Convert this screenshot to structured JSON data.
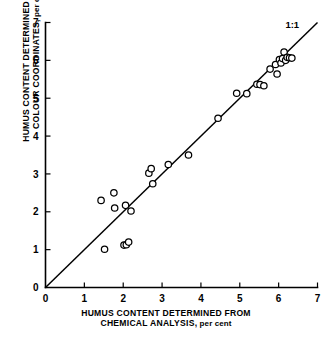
{
  "chart_data": {
    "type": "scatter",
    "title": "",
    "xlabel": "HUMUS CONTENT DETERMINED FROM CHEMICAL ANALYSIS, per cent",
    "ylabel": "HUMUS CONTENT DETERMINED FROM COLOUR COORDINATES, per cent",
    "xlim": [
      0,
      7
    ],
    "ylim": [
      0,
      7
    ],
    "xticks": [
      "0",
      "1",
      "2",
      "3",
      "4",
      "5",
      "6",
      "7"
    ],
    "yticks": [
      "0",
      "1",
      "2",
      "3",
      "4",
      "5",
      "6",
      "7"
    ],
    "xtick_values": [
      0,
      1,
      2,
      3,
      4,
      5,
      6,
      7
    ],
    "ytick_values": [
      0,
      1,
      2,
      3,
      4,
      5,
      6,
      7
    ],
    "grid": false,
    "legend": "none",
    "marker": "open-circle",
    "annotations": [
      {
        "text": "1:1",
        "x": 6.35,
        "y": 6.85,
        "describes": "one-to-one reference line"
      }
    ],
    "reference_line": {
      "label": "1:1",
      "type": "identity",
      "from": [
        0,
        0
      ],
      "to": [
        7,
        7
      ]
    },
    "series": [
      {
        "name": "Soil samples",
        "points": [
          [
            1.43,
            2.3
          ],
          [
            1.52,
            1.01
          ],
          [
            1.76,
            2.5
          ],
          [
            1.78,
            2.1
          ],
          [
            2.02,
            1.12
          ],
          [
            2.06,
            2.17
          ],
          [
            2.08,
            1.13
          ],
          [
            2.14,
            1.2
          ],
          [
            2.2,
            2.02
          ],
          [
            2.66,
            3.02
          ],
          [
            2.72,
            3.14
          ],
          [
            2.76,
            2.74
          ],
          [
            3.16,
            3.25
          ],
          [
            3.68,
            3.5
          ],
          [
            4.44,
            4.47
          ],
          [
            4.92,
            5.13
          ],
          [
            5.18,
            5.12
          ],
          [
            5.44,
            5.37
          ],
          [
            5.52,
            5.36
          ],
          [
            5.62,
            5.33
          ],
          [
            5.78,
            5.77
          ],
          [
            5.92,
            5.89
          ],
          [
            5.96,
            5.64
          ],
          [
            6.02,
            6.02
          ],
          [
            6.06,
            5.93
          ],
          [
            6.1,
            6.05
          ],
          [
            6.14,
            6.22
          ],
          [
            6.18,
            6.0
          ],
          [
            6.22,
            6.08
          ],
          [
            6.28,
            6.07
          ],
          [
            6.34,
            6.06
          ]
        ]
      }
    ]
  },
  "axes": {
    "x": {
      "title_line1": "HUMUS CONTENT DETERMINED FROM",
      "title_line2_main": "CHEMICAL ANALYSIS,",
      "title_line2_units": " per cent"
    },
    "y": {
      "title_line1": "HUMUS CONTENT DETERMINED FROM",
      "title_line2_main": "COLOUR COORDINATES,",
      "title_line2_units": " per cent"
    }
  },
  "reference": {
    "label": "1:1"
  }
}
